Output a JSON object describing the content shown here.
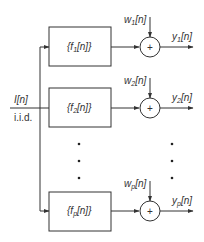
{
  "diagram": {
    "input": {
      "label": "I[n]",
      "sublabel": "i.i.d."
    },
    "branches": [
      {
        "filter": "{f1[n]}",
        "noise": "w1[n]",
        "output": "y1[n]",
        "filter_base": "{f",
        "filter_sub": "1",
        "filter_tail": "[n]}",
        "noise_base": "w",
        "noise_sub": "1",
        "noise_tail": "[n]",
        "output_base": "y",
        "output_sub": "1",
        "output_tail": "[n]"
      },
      {
        "filter": "{f2[n]}",
        "noise": "w2[n]",
        "output": "y2[n]",
        "filter_base": "{f",
        "filter_sub": "2",
        "filter_tail": "[n]}",
        "noise_base": "w",
        "noise_sub": "2",
        "noise_tail": "[n]",
        "output_base": "y",
        "output_sub": "2",
        "output_tail": "[n]"
      },
      {
        "filter": "{fp[n]}",
        "noise": "wp[n]",
        "output": "yp[n]",
        "filter_base": "{f",
        "filter_sub": "p",
        "filter_tail": "[n]}",
        "noise_base": "w",
        "noise_sub": "p",
        "noise_tail": "[n]",
        "output_base": "y",
        "output_sub": "p",
        "output_tail": "[n]"
      }
    ],
    "summer_symbol": "+",
    "ellipsis": "⋮",
    "colors": {
      "line": "#333333",
      "background": "#ffffff"
    }
  }
}
